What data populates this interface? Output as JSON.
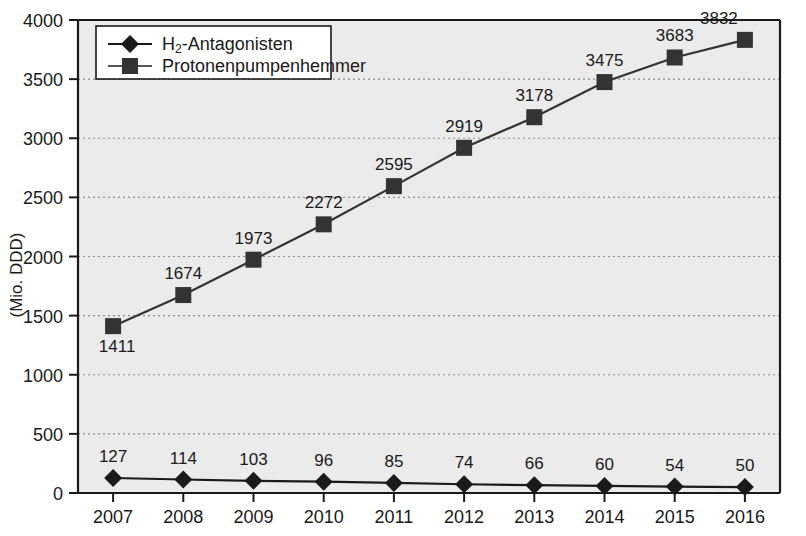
{
  "chart_data": {
    "type": "line",
    "title": "",
    "xlabel": "",
    "ylabel": "(Mio. DDD)",
    "categories": [
      "2007",
      "2008",
      "2009",
      "2010",
      "2011",
      "2012",
      "2013",
      "2014",
      "2015",
      "2016"
    ],
    "ylim": [
      0,
      4000
    ],
    "y_ticks": [
      "0",
      "500",
      "1000",
      "1500",
      "2000",
      "2500",
      "3000",
      "3500",
      "4000"
    ],
    "y_tick_values": [
      0,
      500,
      1000,
      1500,
      2000,
      2500,
      3000,
      3500,
      4000
    ],
    "grid": true,
    "grid_style": "dotted-horizontal",
    "legend_position": "top-left-inside",
    "series": [
      {
        "name": "H2-Antagonisten",
        "name_prefix": "H",
        "name_subscript": "2",
        "name_suffix": "-Antagonisten",
        "marker": "diamond",
        "color": "#1a1a1a",
        "values": [
          127,
          114,
          103,
          96,
          85,
          74,
          66,
          60,
          54,
          50
        ],
        "labels": [
          "127",
          "114",
          "103",
          "96",
          "85",
          "74",
          "66",
          "60",
          "54",
          "50"
        ],
        "label_position": "above"
      },
      {
        "name": "Protonenpumpenhemmer",
        "name_prefix": "Protonenpumpenhemmer",
        "name_subscript": "",
        "name_suffix": "",
        "marker": "square",
        "color": "#333333",
        "values": [
          1411,
          1674,
          1973,
          2272,
          2595,
          2919,
          3178,
          3475,
          3683,
          3832
        ],
        "labels": [
          "1411",
          "1674",
          "1973",
          "2272",
          "2595",
          "2919",
          "3178",
          "3475",
          "3683",
          "3832"
        ],
        "label_position": "above-except-first"
      }
    ]
  },
  "style": {
    "plot_background": "#ebebeb",
    "axis_color": "#1a1a1a",
    "grid_color": "#8c8c8c",
    "legend_background": "#ffffff",
    "legend_border": "#1a1a1a",
    "text_color": "#1a1a1a"
  }
}
